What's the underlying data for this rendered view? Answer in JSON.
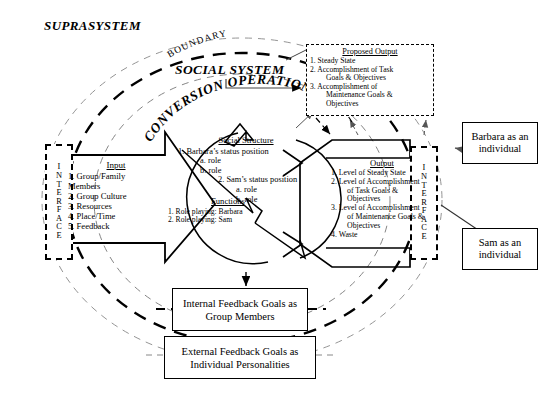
{
  "diagram": {
    "suprasystem_label": "SUPRASYSTEM",
    "boundary_label": "BOUNDARY",
    "social_system_label": "SOCIAL SYSTEM",
    "conversion_operations_label": "CONVERSION OPERATIONS"
  },
  "interface_left": {
    "name": "INTERFACE",
    "letters": [
      "I",
      "N",
      "T",
      "E",
      "R",
      "F",
      "A",
      "C",
      "E"
    ]
  },
  "interface_right": {
    "name": "INTERFACE",
    "letters": [
      "I",
      "N",
      "T",
      "E",
      "R",
      "F",
      "A",
      "C",
      "E"
    ]
  },
  "input": {
    "title": "Input",
    "items": [
      "1. Group/Family",
      "Members",
      "2. Group Culture",
      "3. Resources",
      "4. Place/Time",
      "5. Feedback"
    ]
  },
  "conversion": {
    "social_structure_title": "Social Structure",
    "social_structure_items": [
      {
        "text": "1. Barbara’s status position",
        "indent": 0
      },
      {
        "text": "a. role",
        "indent": 1
      },
      {
        "text": "b. role",
        "indent": 1
      },
      {
        "text": "2. Sam’s status position",
        "indent": 2
      },
      {
        "text": "a. role",
        "indent": 3
      },
      {
        "text": "b. role",
        "indent": 3
      }
    ],
    "functions_title": "Functions",
    "functions_items": [
      "1. Role playing: Barbara",
      "2. Role playing: Sam"
    ]
  },
  "output": {
    "title": "Output",
    "items": [
      {
        "num": "1.",
        "lines": [
          "Level of Steady State"
        ]
      },
      {
        "num": "2.",
        "lines": [
          "Level of Accomplishment",
          "of Task Goals & Objectives"
        ]
      },
      {
        "num": "3.",
        "lines": [
          "Level of Accomplishment",
          "of Maintenance Goals &",
          "Objectives"
        ]
      },
      {
        "num": "4.",
        "lines": [
          "Waste"
        ]
      }
    ]
  },
  "proposed_output": {
    "title": "Proposed Output",
    "items": [
      {
        "num": "1.",
        "lines": [
          "Steady State"
        ]
      },
      {
        "num": "2.",
        "lines": [
          "Accomplishment of Task",
          "Goals & Objectives"
        ]
      },
      {
        "num": "3.",
        "lines": [
          "Accomplishment of",
          "Maintenance Goals &",
          "Objectives"
        ]
      }
    ]
  },
  "feedback": {
    "internal": "Internal Feedback Goals as Group Members",
    "external": "External Feedback Goals as Individual Personalities"
  },
  "individuals": {
    "barbara": "Barbara as an individual",
    "sam": "Sam as an individual"
  },
  "colors": {
    "stroke": "#000000",
    "background": "#ffffff",
    "light_dash": "#888888"
  }
}
